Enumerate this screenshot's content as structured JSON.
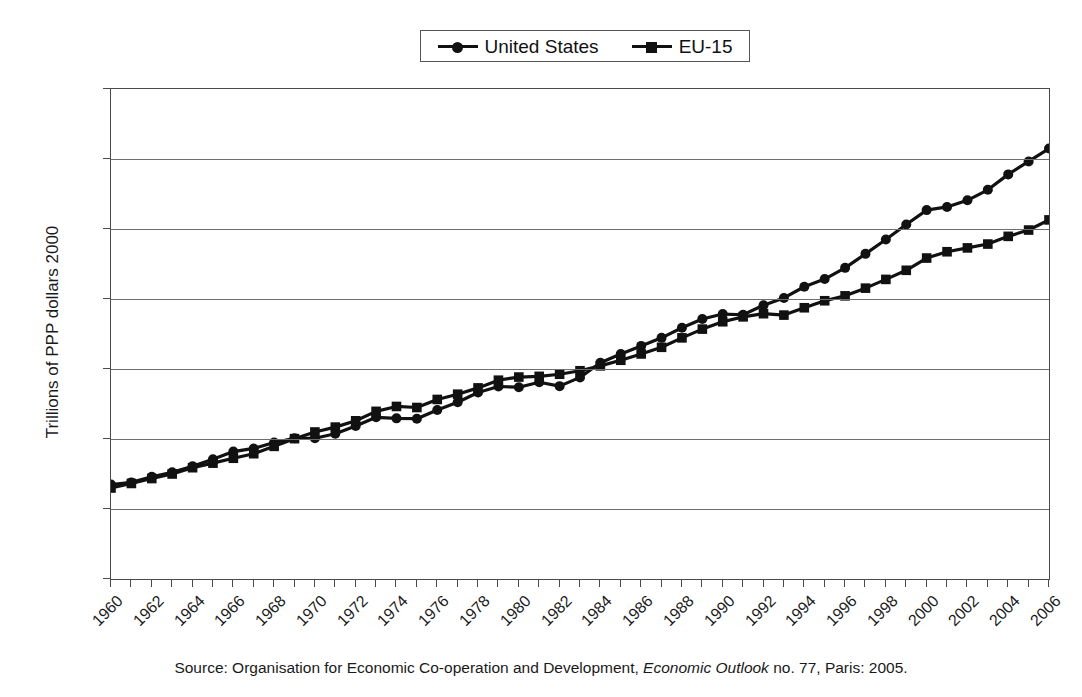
{
  "chart_data": {
    "type": "line",
    "title": "",
    "xlabel": "",
    "ylabel": "Trillions of PPP dollars 2000",
    "xlim": [
      1960,
      2006
    ],
    "ylim": [
      0,
      14
    ],
    "ytick_step": 2,
    "xtick_step": 2,
    "grid": true,
    "legend_position": "top-center",
    "x": [
      1960,
      1961,
      1962,
      1963,
      1964,
      1965,
      1966,
      1967,
      1968,
      1969,
      1970,
      1971,
      1972,
      1973,
      1974,
      1975,
      1976,
      1977,
      1978,
      1979,
      1980,
      1981,
      1982,
      1983,
      1984,
      1985,
      1986,
      1987,
      1988,
      1989,
      1990,
      1991,
      1992,
      1993,
      1994,
      1995,
      1996,
      1997,
      1998,
      1999,
      2000,
      2001,
      2002,
      2003,
      2004,
      2005,
      2006
    ],
    "ytick_labels": [
      "0",
      "2",
      "4",
      "6",
      "8",
      "10",
      "12",
      "14"
    ],
    "xtick_labels": [
      "1960",
      "1962",
      "1964",
      "1966",
      "1968",
      "1970",
      "1972",
      "1974",
      "1976",
      "1978",
      "1980",
      "1982",
      "1984",
      "1986",
      "1988",
      "1990",
      "1992",
      "1994",
      "1996",
      "1998",
      "2000",
      "2002",
      "2004",
      "2006"
    ],
    "series": [
      {
        "name": "United States",
        "marker": "circle",
        "color": "#111111",
        "values": [
          2.7,
          2.76,
          2.92,
          3.05,
          3.22,
          3.42,
          3.64,
          3.73,
          3.9,
          4.02,
          4.02,
          4.15,
          4.37,
          4.62,
          4.59,
          4.58,
          4.83,
          5.05,
          5.33,
          5.5,
          5.48,
          5.62,
          5.51,
          5.76,
          6.18,
          6.43,
          6.66,
          6.89,
          7.18,
          7.43,
          7.57,
          7.55,
          7.82,
          8.03,
          8.35,
          8.57,
          8.89,
          9.29,
          9.7,
          10.13,
          10.54,
          10.63,
          10.82,
          11.12,
          11.56,
          11.93,
          12.3
        ]
      },
      {
        "name": "EU-15",
        "marker": "square",
        "color": "#111111",
        "values": [
          2.6,
          2.73,
          2.87,
          3.0,
          3.18,
          3.31,
          3.45,
          3.58,
          3.79,
          4.01,
          4.2,
          4.34,
          4.52,
          4.79,
          4.93,
          4.9,
          5.13,
          5.28,
          5.46,
          5.68,
          5.77,
          5.79,
          5.85,
          5.95,
          6.09,
          6.25,
          6.43,
          6.62,
          6.89,
          7.14,
          7.35,
          7.49,
          7.58,
          7.54,
          7.75,
          7.95,
          8.09,
          8.31,
          8.56,
          8.82,
          9.17,
          9.35,
          9.46,
          9.57,
          9.79,
          9.97,
          10.26
        ]
      }
    ]
  },
  "legend": {
    "entries": [
      {
        "label": "United States",
        "marker": "circle"
      },
      {
        "label": "EU-15",
        "marker": "square"
      }
    ]
  },
  "caption": {
    "prefix": "Source: Organisation for Economic Co-operation and Development, ",
    "italic": "Economic Outlook",
    "suffix": " no. 77, Paris: 2005."
  }
}
